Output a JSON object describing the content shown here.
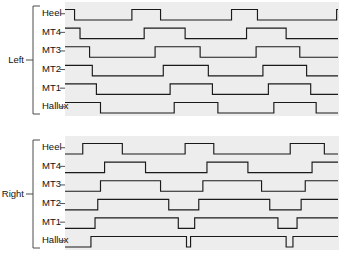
{
  "figure": {
    "title": "",
    "background_color": "#ffffff",
    "panel_background_color": "#ededed",
    "trace_color": "#1a1a1a",
    "label_color": "#111111",
    "bracket_color": "#4d4d4d",
    "width": 339,
    "height": 260
  },
  "groups": [
    {
      "id": "left",
      "label": "Left"
    },
    {
      "id": "right",
      "label": "Right"
    }
  ],
  "row_labels": [
    "Heel",
    "MT4",
    "MT3",
    "MT2",
    "MT1",
    "Hallux"
  ],
  "chart_data": {
    "type": "line",
    "subtype": "digital-step-timing-diagram",
    "title": "",
    "xlabel": "",
    "ylabel": "",
    "xlim": [
      0,
      100
    ],
    "ylim": [
      0,
      1
    ],
    "grid": false,
    "legend": "none",
    "axis_ticks_visible": false,
    "value_meaning": {
      "0": "sensor off (no contact)",
      "1": "sensor on (contact)"
    },
    "panels": [
      {
        "name": "Left",
        "series": [
          {
            "name": "Heel",
            "x": [
              0,
              3.5,
              3.5,
              24.5,
              24.5,
              35,
              35,
              61,
              61,
              70.5,
              70.5,
              99.5,
              99.5,
              100
            ],
            "values": [
              1,
              1,
              0,
              0,
              1,
              1,
              0,
              0,
              1,
              1,
              0,
              0,
              1,
              1
            ]
          },
          {
            "name": "MT4",
            "x": [
              0,
              5.5,
              5.5,
              29,
              29,
              44,
              44,
              66.5,
              66.5,
              81,
              81,
              100
            ],
            "values": [
              1,
              1,
              0,
              0,
              1,
              1,
              0,
              0,
              1,
              1,
              0,
              0
            ]
          },
          {
            "name": "MT3",
            "x": [
              0,
              9,
              9,
              33,
              33,
              49.5,
              49.5,
              70,
              70,
              86,
              86,
              100
            ],
            "values": [
              1,
              1,
              0,
              0,
              1,
              1,
              0,
              0,
              1,
              1,
              0,
              0
            ]
          },
          {
            "name": "MT2",
            "x": [
              0,
              10,
              10,
              36,
              36,
              52.5,
              52.5,
              72.5,
              72.5,
              88.5,
              88.5,
              100
            ],
            "values": [
              1,
              1,
              0,
              0,
              1,
              1,
              0,
              0,
              1,
              1,
              0,
              0
            ]
          },
          {
            "name": "MT1",
            "x": [
              0,
              11.5,
              11.5,
              38.5,
              38.5,
              54,
              54,
              74.5,
              74.5,
              90,
              90,
              100
            ],
            "values": [
              1,
              1,
              0,
              0,
              1,
              1,
              0,
              0,
              1,
              1,
              0,
              0
            ]
          },
          {
            "name": "Hallux",
            "x": [
              0,
              13,
              13,
              40,
              40,
              56,
              56,
              76.5,
              76.5,
              92,
              92,
              100
            ],
            "values": [
              1,
              1,
              0,
              0,
              1,
              1,
              0,
              0,
              1,
              1,
              0,
              0
            ]
          }
        ]
      },
      {
        "name": "Right",
        "series": [
          {
            "name": "Heel",
            "x": [
              0,
              6.5,
              6.5,
              21,
              21,
              44,
              44,
              54.5,
              54.5,
              82.5,
              82.5,
              95,
              95,
              100
            ],
            "values": [
              0,
              0,
              1,
              1,
              0,
              0,
              1,
              1,
              0,
              0,
              1,
              1,
              0,
              0
            ]
          },
          {
            "name": "MT4",
            "x": [
              0,
              14.5,
              14.5,
              29.5,
              29.5,
              52,
              52,
              67,
              67,
              90.5,
              90.5,
              100
            ],
            "values": [
              0,
              0,
              1,
              1,
              0,
              0,
              1,
              1,
              0,
              0,
              1,
              1
            ]
          },
          {
            "name": "MT3",
            "x": [
              0,
              13,
              13,
              35,
              35,
              50.5,
              50.5,
              72,
              72,
              88,
              88,
              100
            ],
            "values": [
              0,
              0,
              1,
              1,
              0,
              0,
              1,
              1,
              0,
              0,
              1,
              1
            ]
          },
          {
            "name": "MT2",
            "x": [
              0,
              12,
              12,
              38,
              38,
              49,
              49,
              75,
              75,
              86.5,
              86.5,
              100
            ],
            "values": [
              0,
              0,
              1,
              1,
              0,
              0,
              1,
              1,
              0,
              0,
              1,
              1
            ]
          },
          {
            "name": "MT1",
            "x": [
              0,
              11,
              11,
              41.5,
              41.5,
              47.5,
              47.5,
              78,
              78,
              85,
              85,
              100
            ],
            "values": [
              0,
              0,
              1,
              1,
              0,
              0,
              1,
              1,
              0,
              0,
              1,
              1
            ]
          },
          {
            "name": "Hallux",
            "x": [
              0,
              9.5,
              9.5,
              44.5,
              44.5,
              46,
              46,
              81,
              81,
              83.5,
              83.5,
              100
            ],
            "values": [
              0,
              0,
              1,
              1,
              0,
              0,
              1,
              1,
              0,
              0,
              1,
              1
            ]
          }
        ]
      }
    ]
  }
}
